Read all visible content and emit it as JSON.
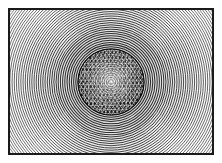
{
  "figure": {
    "caption": "",
    "kind": "engraving-plate",
    "canvas": {
      "width": 222,
      "height": 163
    },
    "background_color": "#fdfdfd",
    "ink_color": "#111111",
    "paper_color": "#ffffff"
  },
  "frame": {
    "name": "plate-border",
    "x": 9,
    "y": 9,
    "width": 204,
    "height": 145,
    "stroke_color": "#1a1a1a",
    "stroke_width": 2,
    "margin_color": "#ffffff"
  },
  "pattern": {
    "name": "concentric-rings",
    "center_x": 111,
    "center_y": 82,
    "ring_count": 64,
    "ring_spacing_px": 2.2,
    "inner_radius_px": 33,
    "outer_radius_px": 172,
    "stroke_color": "#222222",
    "stroke_width": 0.85,
    "description": "Fine concentric arcs radiating outward, clipped to the plate border"
  },
  "core": {
    "name": "dark-textured-disc",
    "center_x": 111,
    "center_y": 82,
    "radius_px": 33,
    "fill_color": "#151515",
    "texture": "cross-hatched checkered moire",
    "highlight_center_radius_px": 11,
    "highlight_color": "#d8d8d8"
  },
  "texture": {
    "hatch_pitch_px": 3.1,
    "hatch_color": "#f2f2f2",
    "grid_color": "#e8e8e8",
    "speckle_color": "#f6f6f6"
  },
  "labels": {
    "alt_text": "Black and white engraved plate showing dense concentric rings around a dark mottled central disc",
    "figure_number": ""
  }
}
